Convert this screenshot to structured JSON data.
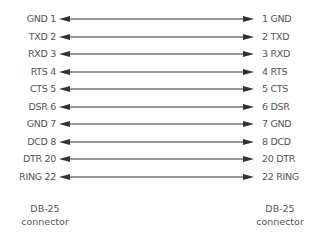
{
  "diagram": {
    "line_color": "#333333",
    "text_color": "#555555",
    "rows": [
      {
        "left": "GND 1",
        "right": "1 GND",
        "y": 19
      },
      {
        "left": "TXD 2",
        "right": "2 TXD",
        "y": 37
      },
      {
        "left": "RXD 3",
        "right": "3 RXD",
        "y": 54
      },
      {
        "left": "RTS 4",
        "right": "4 RTS",
        "y": 72
      },
      {
        "left": "CTS 5",
        "right": "5 CTS",
        "y": 89
      },
      {
        "left": "DSR 6",
        "right": "6 DSR",
        "y": 107
      },
      {
        "left": "GND 7",
        "right": "7 GND",
        "y": 124
      },
      {
        "left": "DCD 8",
        "right": "8 DCD",
        "y": 142
      },
      {
        "left": "DTR 20",
        "right": "20 DTR",
        "y": 159
      },
      {
        "left": "RING 22",
        "right": "22 RING",
        "y": 177
      }
    ],
    "left_connector": {
      "line1": "DB-25",
      "line2": "connector"
    },
    "right_connector": {
      "line1": "DB-25",
      "line2": "connector"
    }
  }
}
